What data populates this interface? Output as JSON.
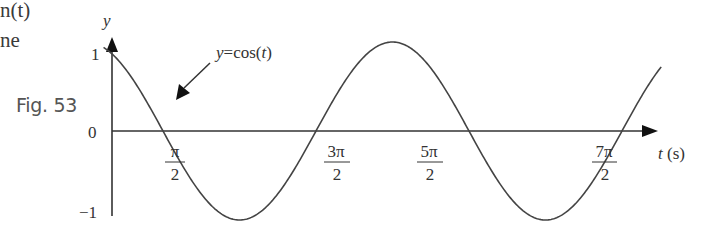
{
  "page_fragment": {
    "line1": "n(t)",
    "line2": "ne"
  },
  "figure_label": "Fig. 53",
  "chart_data": {
    "type": "line",
    "title": "",
    "annotation": "y = cos(t)",
    "xlabel": "t (s)",
    "ylabel": "y",
    "yticks": [
      "1",
      "0",
      "−1"
    ],
    "xticks": [
      {
        "num": "π",
        "den": "2",
        "value": 1.5708
      },
      {
        "num": "3π",
        "den": "2",
        "value": 4.7124
      },
      {
        "num": "5π",
        "den": "2",
        "value": 7.854
      },
      {
        "num": "7π",
        "den": "2",
        "value": 10.9956
      }
    ],
    "ylim": [
      -1,
      1
    ],
    "xlim": [
      0,
      12.2
    ],
    "grid": false,
    "legend": "none",
    "series": [
      {
        "name": "y = cos(t)",
        "function": "cos(t)",
        "x": [
          0.35,
          1.5708,
          3.1416,
          4.7124,
          6.2832,
          7.854,
          9.4248,
          10.9956,
          11.8
        ],
        "values": [
          0.94,
          0,
          -1,
          0,
          1,
          0,
          -1,
          0,
          0.92
        ]
      }
    ],
    "color": "#333333"
  }
}
